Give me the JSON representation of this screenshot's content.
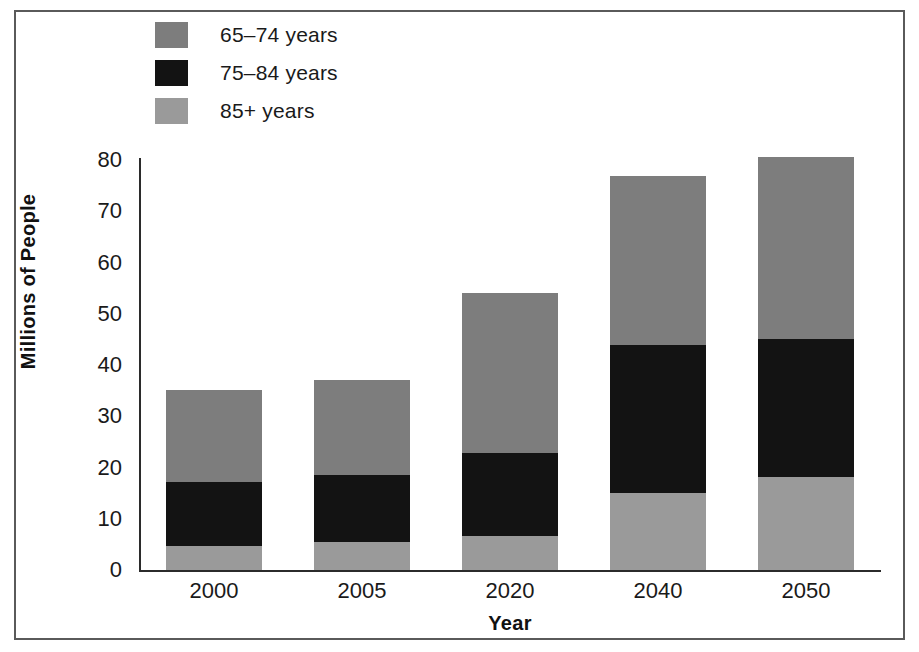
{
  "figure": {
    "background": "#ffffff",
    "frame_color": "#5a5a5a"
  },
  "legend": {
    "position": "top-left",
    "items": [
      {
        "label": "65–74 years",
        "color": "#7d7d7d",
        "key": "65-74"
      },
      {
        "label": "75–84 years",
        "color": "#131313",
        "key": "75-84"
      },
      {
        "label": "85+ years",
        "color": "#9a9a9a",
        "key": "85+"
      }
    ]
  },
  "axes": {
    "y": {
      "title": "Millions of People",
      "ticks": [
        "0",
        "10",
        "20",
        "30",
        "40",
        "50",
        "60",
        "70",
        "80"
      ],
      "min": 0,
      "max": 80
    },
    "x": {
      "title": "Year",
      "ticks": [
        "2000",
        "2005",
        "2020",
        "2040",
        "2050"
      ]
    }
  },
  "chart_data": {
    "type": "bar",
    "stacked": true,
    "title": "",
    "xlabel": "Year",
    "ylabel": "Millions of People",
    "categories": [
      "2000",
      "2005",
      "2020",
      "2040",
      "2050"
    ],
    "ylim": [
      0,
      80
    ],
    "grid": false,
    "legend_position": "top-left",
    "series": [
      {
        "name": "85+ years",
        "color": "#9a9a9a",
        "values": [
          4.7,
          5.4,
          6.6,
          15.0,
          18.2
        ]
      },
      {
        "name": "75–84 years",
        "color": "#131313",
        "values": [
          12.5,
          13.1,
          16.2,
          28.9,
          26.9
        ]
      },
      {
        "name": "65–74 years",
        "color": "#7d7d7d",
        "values": [
          18.0,
          18.5,
          31.2,
          33.0,
          35.5
        ]
      }
    ],
    "totals": [
      35.2,
      37.0,
      54.0,
      76.9,
      80.6
    ]
  }
}
